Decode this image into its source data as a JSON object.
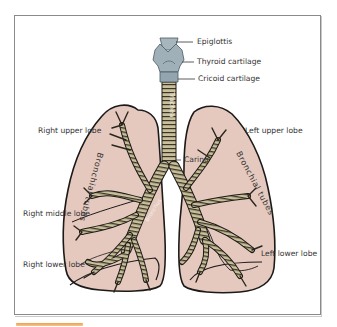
{
  "diagram": {
    "labels": {
      "epiglottis": "Epiglottis",
      "thyroid_cartilage": "Thyroid cartilage",
      "cricoid_cartilage": "Cricoid cartilage",
      "right_upper_lobe": "Right upper lobe",
      "left_upper_lobe": "Left upper lobe",
      "carina": "Carina",
      "right_middle_lobe": "Right middle lobe",
      "right_lower_lobe": "Right lower lobe",
      "left_lower_lobe": "Left lower lobe",
      "trachea": "Trachea",
      "bronchial_tubes_right": "Bronchial tubes",
      "bronchial_tubes_left": "Bronchial tubes",
      "bronchus": "Bronchus"
    },
    "colors": {
      "lung_fill": "#e5c9bf",
      "outline": "#1c1a18",
      "airway": "#c9bf9a",
      "airway_ring": "#3a3526",
      "larynx": "#9fb0b8",
      "frame": "#8a8a8a",
      "accent_bar": "#f0a04a"
    }
  }
}
